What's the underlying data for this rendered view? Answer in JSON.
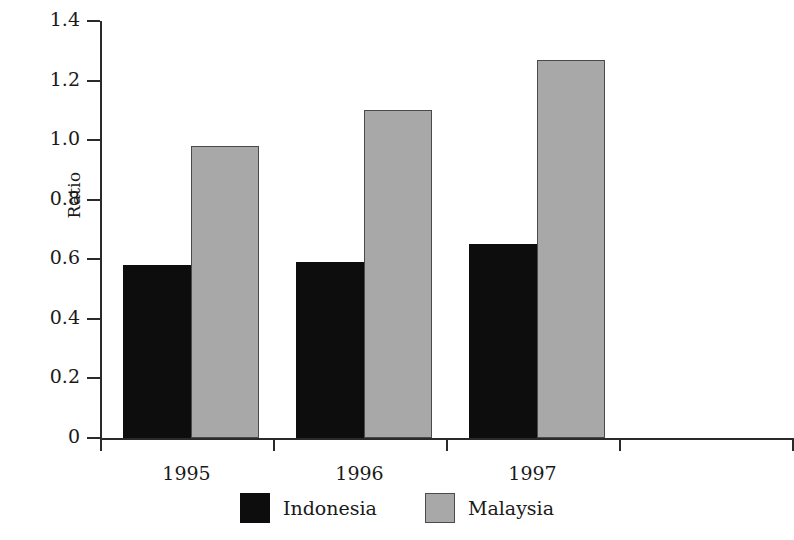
{
  "chart_data": {
    "type": "bar",
    "title": "",
    "subtitle": "",
    "xlabel": "",
    "ylabel": "Ratio",
    "categories": [
      "1995",
      "1996",
      "1997"
    ],
    "series": [
      {
        "name": "Indonesia",
        "color": "#0d0d0d",
        "values": [
          0.58,
          0.59,
          0.65
        ]
      },
      {
        "name": "Malaysia",
        "color": "#a8a8a8",
        "values": [
          0.98,
          1.1,
          1.27
        ]
      }
    ],
    "ylim": [
      0,
      1.4
    ],
    "ytick_labels": [
      "0",
      "0.2",
      "0.4",
      "0.6",
      "0.8",
      "1.0",
      "1.2",
      "1.4"
    ],
    "ytick_values": [
      0,
      0.2,
      0.4,
      0.6,
      0.8,
      1.0,
      1.2,
      1.4
    ],
    "grid": false,
    "legend_position": "bottom-center",
    "annotations": []
  }
}
